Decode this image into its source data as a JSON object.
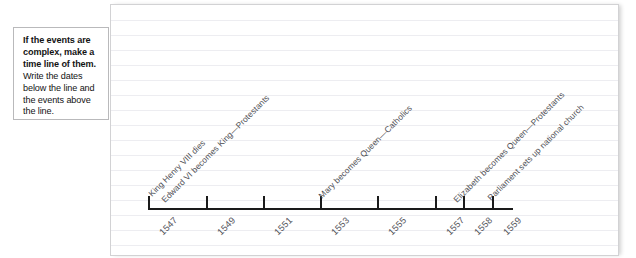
{
  "callout": {
    "lead": "If the events are complex, make a time line of them.",
    "rest": " Write the dates below the line and the events above the line."
  },
  "timeline": {
    "axis_start_year": 1547,
    "axis_end_year": 1559,
    "ticks": [
      {
        "year": "1547",
        "x": 148
      },
      {
        "year": "1549",
        "x": 206
      },
      {
        "year": "1551",
        "x": 263
      },
      {
        "year": "1553",
        "x": 320
      },
      {
        "year": "1555",
        "x": 377
      },
      {
        "year": "1557",
        "x": 435
      },
      {
        "year": "1558",
        "x": 463
      },
      {
        "year": "1559",
        "x": 492
      }
    ],
    "events": [
      {
        "label": "King Henry VIII dies",
        "year": "1547",
        "x": 150,
        "y": 190
      },
      {
        "label": "Edward VI becomes King—Protestants",
        "year": "1547",
        "x": 163,
        "y": 196
      },
      {
        "label": "Mary becomes Queen—Catholics",
        "year": "1553",
        "x": 320,
        "y": 192
      },
      {
        "label": "Elizabeth becomes Queen—Protestants",
        "year": "1558",
        "x": 455,
        "y": 196
      },
      {
        "label": "Parliament sets up national church",
        "year": "1559",
        "x": 489,
        "y": 194
      }
    ]
  },
  "colors": {
    "ink": "#1b1b1b",
    "pencil": "#4f4f55",
    "rule": "#ededf1",
    "page_border": "#d2d2d4"
  }
}
